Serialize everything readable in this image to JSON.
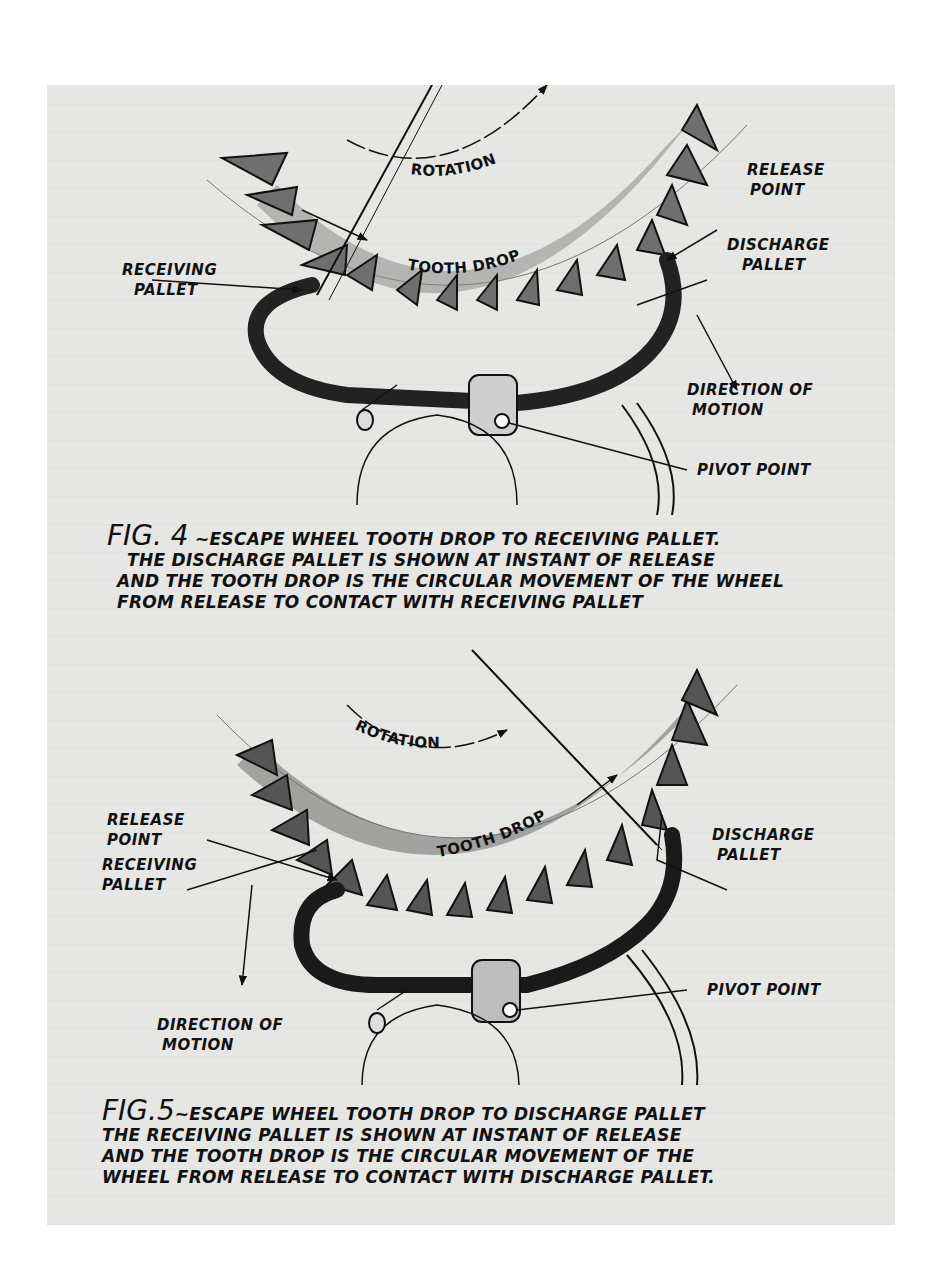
{
  "figures": [
    {
      "id": "fig4",
      "labels": {
        "rotation": "ROTATION",
        "tooth_drop": "TOOTH DROP",
        "receiving_pallet": [
          "RECEIVING",
          "PALLET"
        ],
        "release_point": [
          "RELEASE",
          "POINT"
        ],
        "discharge_pallet": [
          "DISCHARGE",
          "PALLET"
        ],
        "direction_of_motion": [
          "DIRECTION OF",
          "MOTION"
        ],
        "pivot_point": "PIVOT POINT"
      },
      "caption": {
        "fig_number": "FIG. 4",
        "lines": [
          "~ESCAPE WHEEL TOOTH DROP TO RECEIVING PALLET.",
          "THE DISCHARGE PALLET IS SHOWN AT INSTANT OF RELEASE",
          "AND THE TOOTH DROP IS THE CIRCULAR MOVEMENT OF THE WHEEL",
          "FROM RELEASE TO CONTACT WITH RECEIVING PALLET"
        ]
      }
    },
    {
      "id": "fig5",
      "labels": {
        "rotation": "ROTATION",
        "tooth_drop": "TOOTH DROP",
        "release_point": [
          "RELEASE",
          "POINT"
        ],
        "receiving_pallet": [
          "RECEIVING",
          "PALLET"
        ],
        "discharge_pallet": [
          "DISCHARGE",
          "PALLET"
        ],
        "direction_of_motion": [
          "DIRECTION OF",
          "MOTION"
        ],
        "pivot_point": "PIVOT POINT"
      },
      "caption": {
        "fig_number": "FIG.5",
        "lines": [
          "~ESCAPE WHEEL TOOTH DROP TO DISCHARGE PALLET",
          "THE RECEIVING PALLET IS SHOWN AT INSTANT OF RELEASE",
          "AND THE TOOTH DROP IS THE CIRCULAR MOVEMENT OF THE",
          "WHEEL FROM RELEASE TO CONTACT WITH DISCHARGE PALLET."
        ]
      }
    }
  ],
  "colors": {
    "paper": "#e6e6e4",
    "ink": "#111111",
    "shade": "#6f6f6f"
  }
}
